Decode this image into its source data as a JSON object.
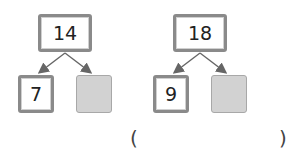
{
  "diagrams": [
    {
      "top": "14",
      "left_child": "7",
      "right_child": ""
    },
    {
      "top": "18",
      "left_child": "9",
      "right_child": ""
    }
  ],
  "answer": {
    "open": "(",
    "value": "",
    "close": ")"
  },
  "colors": {
    "border": "#8a8a8a",
    "blank_fill": "#d2d2d2",
    "arrow": "#666666"
  }
}
